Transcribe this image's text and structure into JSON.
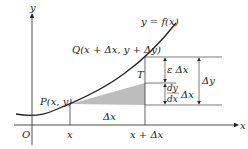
{
  "diagram": {
    "axes": {
      "x_label": "x",
      "y_label": "y",
      "origin_label": "O"
    },
    "curve_label": "y = f(x)",
    "points": {
      "P": "P(x, y)",
      "Q": "Q(x + Δx, y + Δy)",
      "T": "T"
    },
    "x_ticks": [
      "x",
      "x + Δx"
    ],
    "shaded_base_label": "Δx",
    "increments": {
      "epsilon_dx": "ε Δx",
      "dy_dx_num": "dy",
      "dy_dx_den": "dx",
      "dy_dx_factor": "Δx",
      "delta_y": "Δy"
    },
    "colors": {
      "line": "#222222",
      "shade": "#bdbdbd"
    }
  }
}
